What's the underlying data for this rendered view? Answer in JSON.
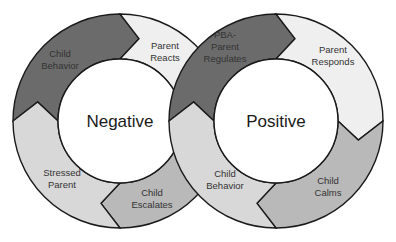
{
  "colors": {
    "dark": "#6b6b6b",
    "light": "#efefef",
    "medium": "#b9b9b9",
    "pale": "#d8d8d8",
    "stroke": "#1a1a1a"
  },
  "geometry": {
    "outer_radius": 107,
    "inner_radius": 62,
    "arrow_depth_deg": 13
  },
  "cycles": [
    {
      "id": "negative",
      "title": "Negative",
      "center": [
        120,
        121
      ],
      "segments": [
        {
          "label_lines": [
            "Child",
            "Behavior"
          ],
          "color": "dark",
          "start": 180,
          "end": 270,
          "label_pos": [
            60,
            60
          ]
        },
        {
          "label_lines": [
            "Parent",
            "Reacts"
          ],
          "color": "light",
          "start": 270,
          "end": 360,
          "label_pos": [
            165,
            52
          ]
        },
        {
          "label_lines": [
            "Child",
            "Escalates"
          ],
          "color": "medium",
          "start": 0,
          "end": 90,
          "label_pos": [
            152,
            199
          ]
        },
        {
          "label_lines": [
            "Stressed",
            "Parent"
          ],
          "color": "pale",
          "start": 90,
          "end": 180,
          "label_pos": [
            62,
            179
          ]
        }
      ]
    },
    {
      "id": "positive",
      "title": "Positive",
      "center": [
        276,
        121
      ],
      "segments": [
        {
          "label_lines": [
            "PBA-",
            "Parent",
            "Regulates"
          ],
          "color": "dark",
          "start": 180,
          "end": 270,
          "label_pos": [
            225,
            47
          ]
        },
        {
          "label_lines": [
            "Parent",
            "Responds"
          ],
          "color": "light",
          "start": 270,
          "end": 360,
          "label_pos": [
            333,
            56
          ]
        },
        {
          "label_lines": [
            "Child",
            "Calms"
          ],
          "color": "medium",
          "start": 0,
          "end": 90,
          "label_pos": [
            328,
            187
          ]
        },
        {
          "label_lines": [
            "Child",
            "Behavior"
          ],
          "color": "pale",
          "start": 90,
          "end": 180,
          "label_pos": [
            225,
            180
          ]
        }
      ]
    }
  ]
}
